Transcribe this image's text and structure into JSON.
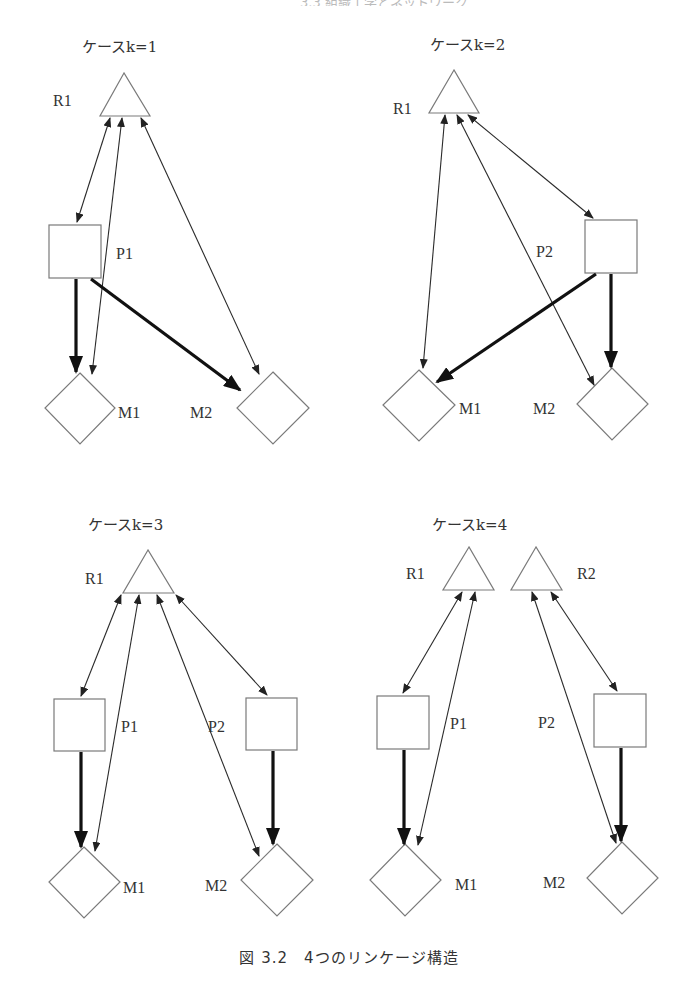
{
  "page_header": "3.3 組織工学とネットワーク",
  "caption": "図 3.2　4つのリンケージ構造",
  "colors": {
    "shape_stroke": "#7a7a7a",
    "thin_arrow": "#2a2a2a",
    "heavy_arrow": "#111111",
    "background": "#ffffff"
  },
  "panels": [
    {
      "title": "ケースk=1",
      "nodes": {
        "R1": {
          "type": "triangle",
          "label": "R1"
        },
        "P1": {
          "type": "square",
          "label": "P1"
        },
        "M1": {
          "type": "diamond",
          "label": "M1"
        },
        "M2": {
          "type": "diamond",
          "label": "M2"
        }
      },
      "edges": [
        {
          "from": "R1",
          "to": "P1",
          "style": "thin-bidirectional"
        },
        {
          "from": "R1",
          "to": "M1",
          "style": "thin-bidirectional"
        },
        {
          "from": "R1",
          "to": "M2",
          "style": "thin-bidirectional"
        },
        {
          "from": "P1",
          "to": "M1",
          "style": "heavy"
        },
        {
          "from": "P1",
          "to": "M2",
          "style": "heavy"
        }
      ]
    },
    {
      "title": "ケースk=2",
      "nodes": {
        "R1": {
          "type": "triangle",
          "label": "R1"
        },
        "P2": {
          "type": "square",
          "label": "P2"
        },
        "M1": {
          "type": "diamond",
          "label": "M1"
        },
        "M2": {
          "type": "diamond",
          "label": "M2"
        }
      },
      "edges": [
        {
          "from": "R1",
          "to": "M1",
          "style": "thin-bidirectional"
        },
        {
          "from": "R1",
          "to": "M2",
          "style": "thin-bidirectional"
        },
        {
          "from": "R1",
          "to": "P2",
          "style": "thin-bidirectional"
        },
        {
          "from": "P2",
          "to": "M1",
          "style": "heavy"
        },
        {
          "from": "P2",
          "to": "M2",
          "style": "heavy"
        }
      ]
    },
    {
      "title": "ケースk=3",
      "nodes": {
        "R1": {
          "type": "triangle",
          "label": "R1"
        },
        "P1": {
          "type": "square",
          "label": "P1"
        },
        "P2": {
          "type": "square",
          "label": "P2"
        },
        "M1": {
          "type": "diamond",
          "label": "M1"
        },
        "M2": {
          "type": "diamond",
          "label": "M2"
        }
      },
      "edges": [
        {
          "from": "R1",
          "to": "P1",
          "style": "thin-bidirectional"
        },
        {
          "from": "R1",
          "to": "M1",
          "style": "thin-bidirectional"
        },
        {
          "from": "R1",
          "to": "M2",
          "style": "thin-bidirectional"
        },
        {
          "from": "R1",
          "to": "P2",
          "style": "thin-bidirectional"
        },
        {
          "from": "P1",
          "to": "M1",
          "style": "heavy"
        },
        {
          "from": "P2",
          "to": "M2",
          "style": "heavy"
        }
      ]
    },
    {
      "title": "ケースk=4",
      "nodes": {
        "R1": {
          "type": "triangle",
          "label": "R1"
        },
        "R2": {
          "type": "triangle",
          "label": "R2"
        },
        "P1": {
          "type": "square",
          "label": "P1"
        },
        "P2": {
          "type": "square",
          "label": "P2"
        },
        "M1": {
          "type": "diamond",
          "label": "M1"
        },
        "M2": {
          "type": "diamond",
          "label": "M2"
        }
      },
      "edges": [
        {
          "from": "R1",
          "to": "P1",
          "style": "thin-bidirectional"
        },
        {
          "from": "R1",
          "to": "M1",
          "style": "thin-bidirectional"
        },
        {
          "from": "R2",
          "to": "M2",
          "style": "thin-bidirectional"
        },
        {
          "from": "R2",
          "to": "P2",
          "style": "thin-bidirectional"
        },
        {
          "from": "P1",
          "to": "M1",
          "style": "heavy"
        },
        {
          "from": "P2",
          "to": "M2",
          "style": "heavy"
        }
      ]
    }
  ]
}
